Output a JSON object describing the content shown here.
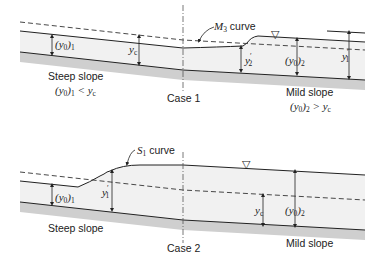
{
  "diagram": {
    "type": "open-channel-flow-profiles",
    "colors": {
      "line": "#222222",
      "water_fill": "#f1f1f1",
      "bed_fill": "#cfcfcf",
      "background": "#ffffff"
    },
    "case1": {
      "title": "Case 1",
      "curve_label": "M",
      "curve_sub": "3",
      "curve_suffix": " curve",
      "left_slope_label": "Steep slope",
      "left_condition": {
        "a": "(y",
        "a_sub": "0",
        "b": ")",
        "b_sub": "1",
        "c": " < y",
        "c_sub": "c"
      },
      "right_slope_label": "Mild slope",
      "right_condition": {
        "a": "(y",
        "a_sub": "0",
        "b": ")",
        "b_sub": "2",
        "c": " > y",
        "c_sub": "c"
      },
      "depth_labels": {
        "y01": {
          "a": "(y",
          "a_sub": "0",
          "b": ")",
          "b_sub": "1"
        },
        "yc": {
          "a": "y",
          "a_sub": "c"
        },
        "y2p": {
          "a": "y",
          "sup": "′",
          "a_sub": "2"
        },
        "y02": {
          "a": "(y",
          "a_sub": "0",
          "b": ")",
          "b_sub": "2"
        },
        "y1p": {
          "a": "y",
          "sup": "′",
          "a_sub": "1"
        }
      },
      "water_surface_symbol": "▽"
    },
    "case2": {
      "title": "Case 2",
      "curve_label": "S",
      "curve_sub": "1",
      "curve_suffix": " curve",
      "left_slope_label": "Steep slope",
      "right_slope_label": "Mild slope",
      "depth_labels": {
        "y01": {
          "a": "(y",
          "a_sub": "0",
          "b": ")",
          "b_sub": "1"
        },
        "y1p": {
          "a": "y",
          "sup": "′",
          "a_sub": "1"
        },
        "yc": {
          "a": "y",
          "a_sub": "c"
        },
        "y02": {
          "a": "(y",
          "a_sub": "0",
          "b": ")",
          "b_sub": "2"
        }
      },
      "water_surface_symbol": "▽"
    }
  }
}
